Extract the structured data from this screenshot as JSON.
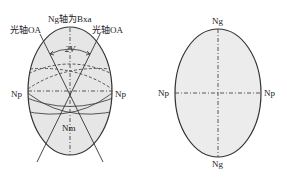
{
  "left_diagram": {
    "title": "Ng轴为Bxa",
    "optic_axis_left": "光轴OA",
    "optic_axis_right": "光轴OA",
    "angle_label": "2V",
    "np_left": "Np",
    "np_right": "Np",
    "nm_label": "Nm"
  },
  "right_diagram": {
    "ng_top": "Ng",
    "ng_bottom": "Ng",
    "np_left": "Np",
    "np_right": "Np"
  },
  "colors": {
    "fill": "#e6e6e6",
    "stroke": "#333333"
  }
}
